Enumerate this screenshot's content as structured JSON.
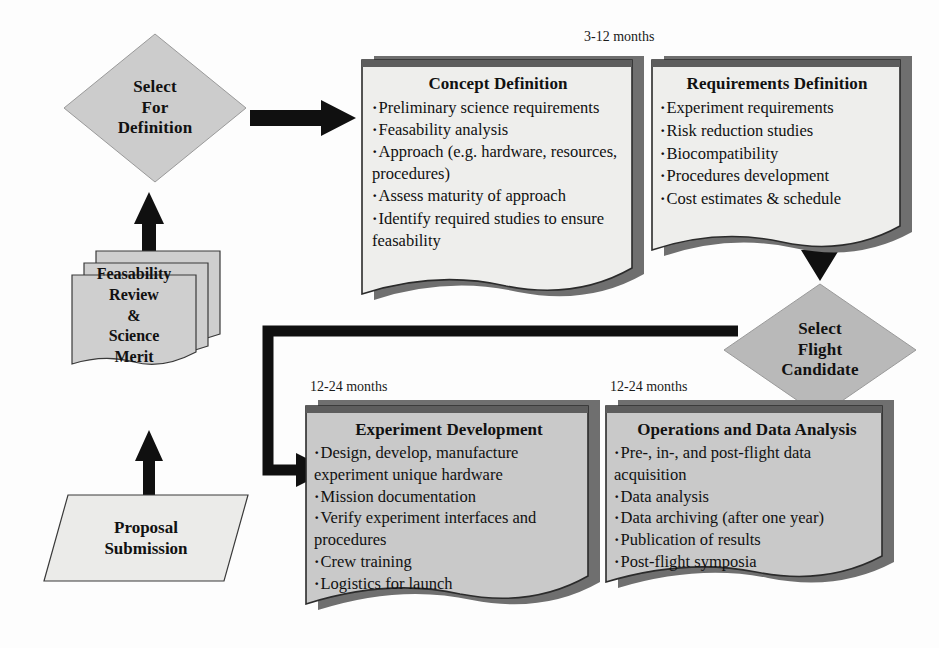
{
  "diagram": {
    "colors": {
      "diamond_fill": "#cccccc",
      "doc_light_fill": "#eeeeec",
      "doc_mid_fill": "#c9c9c9",
      "sheet_fill": "#cfcfcf",
      "para_fill": "#ebebe9",
      "shadow": "#6f6f6f",
      "outline": "#2b2b2b",
      "arrow": "#101010",
      "background": "#fdfdfd"
    }
  },
  "nodes": {
    "select_for_definition": {
      "name": "select-for-definition",
      "shape": "diamond",
      "lines": [
        "Select",
        "For",
        "Definition"
      ]
    },
    "feasability_review": {
      "name": "feasability-review-science-merit",
      "shape": "stacked-documents",
      "sheets": 3,
      "lines": [
        "Feasability",
        "Review",
        "&",
        "Science",
        "Merit"
      ]
    },
    "proposal_submission": {
      "name": "proposal-submission",
      "shape": "parallelogram",
      "lines": [
        "Proposal",
        "Submission"
      ]
    },
    "concept_definition": {
      "name": "concept-definition",
      "shape": "document",
      "caption": "3-12 months",
      "title": "Concept Definition",
      "items": [
        "Preliminary science requirements",
        "Feasability analysis",
        "Approach (e.g. hardware, resources, procedures)",
        "Assess maturity of approach",
        "Identify required studies to ensure feasability"
      ]
    },
    "requirements_definition": {
      "name": "requirements-definition",
      "shape": "document",
      "title": "Requirements Definition",
      "items": [
        "Experiment requirements",
        "Risk reduction studies",
        "Biocompatibility",
        "Procedures development",
        "Cost estimates & schedule"
      ]
    },
    "select_flight_candidate": {
      "name": "select-flight-candidate",
      "shape": "diamond",
      "lines": [
        "Select",
        "Flight",
        "Candidate"
      ]
    },
    "experiment_development": {
      "name": "experiment-development",
      "shape": "document",
      "caption": "12-24 months",
      "title": "Experiment Development",
      "items": [
        "Design, develop, manufacture experiment unique hardware",
        "Mission documentation",
        "Verify experiment interfaces and procedures",
        "Crew training",
        "Logistics for launch"
      ]
    },
    "operations_and_data_analysis": {
      "name": "operations-and-data-analysis",
      "shape": "document",
      "caption": "12-24 months",
      "title": "Operations and Data Analysis",
      "items": [
        "Pre-, in-, and post-flight data acquisition",
        "Data analysis",
        "Data archiving (after one year)",
        "Publication of results",
        "Post-flight symposia"
      ]
    }
  },
  "connectors": [
    {
      "name": "arrow-proposal-to-feasability",
      "direction": "up"
    },
    {
      "name": "arrow-feasability-to-select-definition",
      "direction": "up"
    },
    {
      "name": "arrow-select-definition-to-concept",
      "direction": "right"
    },
    {
      "name": "arrow-requirements-to-select-flight",
      "direction": "down"
    },
    {
      "name": "arrow-select-flight-to-experiment-development",
      "direction": "elbow-left-down-right"
    }
  ]
}
